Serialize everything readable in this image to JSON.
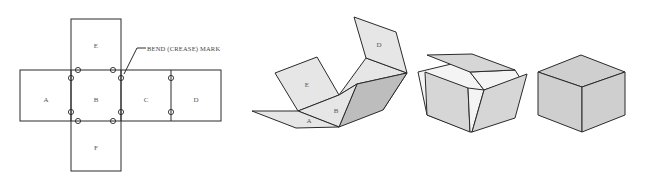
{
  "figure": {
    "net": {
      "panels": [
        "A",
        "B",
        "C",
        "D",
        "E",
        "F"
      ],
      "callout": "BEND (CREASE) MARK",
      "crease_mark_count": 10
    },
    "stages": [
      {
        "name": "flat net",
        "visible_labels": [
          "A",
          "B",
          "C",
          "D",
          "E",
          "F"
        ]
      },
      {
        "name": "partially folded",
        "visible_labels": [
          "A",
          "B",
          "D",
          "E"
        ]
      },
      {
        "name": "nearly closed",
        "visible_labels": []
      },
      {
        "name": "closed cube",
        "visible_labels": []
      }
    ],
    "colors": {
      "line": "#2a2a2a",
      "face_light": "#e6e6e6",
      "face_mid": "#d6d6d6",
      "face_dark": "#bdbdbd",
      "cube_face": "#cfcfcf"
    }
  }
}
